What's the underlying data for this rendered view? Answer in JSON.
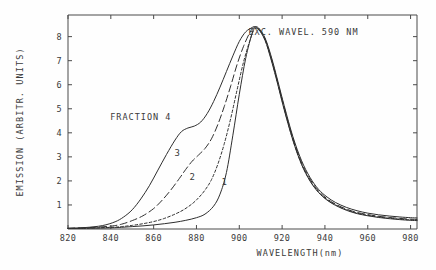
{
  "chart_data": {
    "type": "line",
    "title": "",
    "xlabel": "WAVELENGTH(nm)",
    "ylabel": "EMISSION (ARBITR. UNITS)",
    "xlim": [
      820,
      983
    ],
    "ylim": [
      0,
      8.9
    ],
    "xticks": [
      820,
      840,
      860,
      880,
      900,
      920,
      940,
      960,
      980
    ],
    "xticklabels": [
      "820",
      "840",
      "860",
      "880",
      "900",
      "920",
      "940",
      "960",
      "980"
    ],
    "yticks": [
      1,
      2,
      3,
      4,
      5,
      6,
      7,
      8
    ],
    "yticklabels": [
      "1",
      "2",
      "3",
      "4",
      "5",
      "6",
      "7",
      "8"
    ],
    "grid": false,
    "legend_position": "inline-curve-labels",
    "annotations": [
      {
        "name": "excitation-note",
        "text": "EXC. WAVEL. 590 NM",
        "x": 930,
        "y": 8.05
      },
      {
        "name": "fraction-note",
        "text": "FRACTION 4",
        "x": 854,
        "y": 4.55
      }
    ],
    "series": [
      {
        "name": "1",
        "label": "1",
        "linestyle": "solid",
        "label_x": 893,
        "label_y": 1.85,
        "x": [
          820,
          830,
          840,
          845,
          850,
          855,
          860,
          865,
          870,
          875,
          880,
          884,
          888,
          891,
          894,
          897,
          900,
          903,
          906,
          907,
          909,
          912,
          915,
          918,
          921,
          925,
          929,
          933,
          937,
          941,
          945,
          950,
          955,
          960,
          965,
          970,
          975,
          980,
          983
        ],
        "y": [
          0.02,
          0.03,
          0.05,
          0.07,
          0.1,
          0.13,
          0.17,
          0.22,
          0.28,
          0.36,
          0.47,
          0.62,
          0.95,
          1.45,
          2.35,
          3.9,
          5.6,
          7.1,
          8.15,
          8.35,
          8.3,
          7.85,
          7.0,
          6.0,
          4.95,
          3.7,
          2.7,
          2.0,
          1.52,
          1.2,
          0.98,
          0.78,
          0.64,
          0.55,
          0.48,
          0.43,
          0.39,
          0.36,
          0.35
        ]
      },
      {
        "name": "2",
        "label": "2",
        "linestyle": "dotted-fine-dash",
        "label_x": 878,
        "label_y": 2.05,
        "x": [
          820,
          830,
          840,
          845,
          850,
          855,
          860,
          865,
          870,
          874,
          878,
          881,
          884,
          887,
          890,
          893,
          896,
          899,
          902,
          905,
          907,
          909,
          912,
          915,
          918,
          921,
          925,
          929,
          933,
          937,
          941,
          945,
          950,
          955,
          960,
          965,
          970,
          975,
          980,
          983
        ],
        "y": [
          0.02,
          0.04,
          0.07,
          0.1,
          0.15,
          0.22,
          0.31,
          0.44,
          0.62,
          0.8,
          1.05,
          1.3,
          1.62,
          2.05,
          2.7,
          3.55,
          4.6,
          5.8,
          6.95,
          7.85,
          8.3,
          8.32,
          7.9,
          7.05,
          6.05,
          5.0,
          3.72,
          2.72,
          2.02,
          1.54,
          1.22,
          1.0,
          0.8,
          0.66,
          0.57,
          0.5,
          0.45,
          0.41,
          0.38,
          0.37
        ]
      },
      {
        "name": "3",
        "label": "3",
        "linestyle": "long-dash",
        "label_x": 871,
        "label_y": 3.05,
        "x": [
          820,
          830,
          840,
          845,
          850,
          855,
          860,
          864,
          868,
          872,
          875,
          878,
          881,
          884,
          887,
          890,
          893,
          896,
          899,
          902,
          905,
          907,
          909,
          912,
          915,
          918,
          921,
          925,
          929,
          933,
          937,
          941,
          945,
          950,
          955,
          960,
          965,
          970,
          975,
          980,
          983
        ],
        "y": [
          0.03,
          0.06,
          0.12,
          0.2,
          0.35,
          0.55,
          0.85,
          1.2,
          1.62,
          2.1,
          2.48,
          2.82,
          3.08,
          3.35,
          3.75,
          4.35,
          5.1,
          5.95,
          6.85,
          7.6,
          8.18,
          8.38,
          8.32,
          7.9,
          7.08,
          6.08,
          5.05,
          3.78,
          2.78,
          2.08,
          1.58,
          1.26,
          1.03,
          0.83,
          0.69,
          0.6,
          0.53,
          0.48,
          0.44,
          0.41,
          0.4
        ]
      },
      {
        "name": "4",
        "label": "FRACTION 4",
        "linestyle": "solid",
        "label_x": 854,
        "label_y": 4.55,
        "x": [
          820,
          828,
          836,
          842,
          846,
          850,
          854,
          858,
          862,
          866,
          870,
          873,
          876,
          879,
          882,
          885,
          888,
          891,
          894,
          897,
          900,
          903,
          906,
          907,
          909,
          912,
          915,
          918,
          921,
          925,
          929,
          933,
          937,
          941,
          945,
          950,
          955,
          960,
          965,
          970,
          975,
          980,
          983
        ],
        "y": [
          0.03,
          0.06,
          0.14,
          0.3,
          0.5,
          0.8,
          1.25,
          1.8,
          2.45,
          3.1,
          3.7,
          4.05,
          4.2,
          4.28,
          4.45,
          4.8,
          5.3,
          5.9,
          6.55,
          7.2,
          7.8,
          8.2,
          8.38,
          8.42,
          8.36,
          7.95,
          7.15,
          6.15,
          5.12,
          3.85,
          2.86,
          2.15,
          1.65,
          1.33,
          1.1,
          0.9,
          0.76,
          0.66,
          0.59,
          0.54,
          0.5,
          0.47,
          0.46
        ]
      }
    ]
  },
  "figure": {
    "name": "emission-spectrum-figure",
    "background": "#fefefe",
    "ink_color": "#2e2e2e"
  }
}
